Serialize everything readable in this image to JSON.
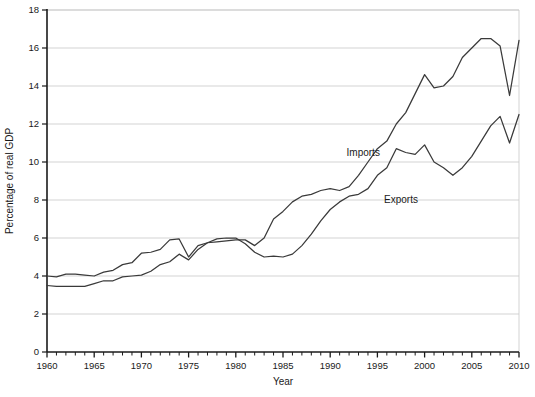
{
  "chart_data": {
    "type": "line",
    "title": "",
    "xlabel": "Year",
    "ylabel": "Percentage of real GDP",
    "xlim": [
      1960,
      2010
    ],
    "ylim": [
      0,
      18
    ],
    "grid": true,
    "grid_axis": "y",
    "legend": "inline-labels",
    "xticks": [
      1960,
      1965,
      1970,
      1975,
      1980,
      1985,
      1990,
      1995,
      2000,
      2005,
      2010
    ],
    "xticklabels": [
      "1960",
      "1965",
      "1970",
      "1975",
      "1980",
      "1985",
      "1990",
      "1995",
      "2000",
      "2005",
      "2010"
    ],
    "xminor_tick_interval": 1,
    "yticks": [
      0,
      2,
      4,
      6,
      8,
      10,
      12,
      14,
      16,
      18
    ],
    "yticklabels": [
      "0",
      "2",
      "4",
      "6",
      "8",
      "10",
      "12",
      "14",
      "16",
      "18"
    ],
    "x": [
      1960,
      1961,
      1962,
      1963,
      1964,
      1965,
      1966,
      1967,
      1968,
      1969,
      1970,
      1971,
      1972,
      1973,
      1974,
      1975,
      1976,
      1977,
      1978,
      1979,
      1980,
      1981,
      1982,
      1983,
      1984,
      1985,
      1986,
      1987,
      1988,
      1989,
      1990,
      1991,
      1992,
      1993,
      1994,
      1995,
      1996,
      1997,
      1998,
      1999,
      2000,
      2001,
      2002,
      2003,
      2004,
      2005,
      2006,
      2007,
      2008,
      2009,
      2010
    ],
    "series": [
      {
        "name": "Imports",
        "label": "Imports",
        "color": "#3a3a3a",
        "values": [
          3.5,
          3.45,
          3.45,
          3.45,
          3.45,
          3.6,
          3.75,
          3.75,
          3.95,
          4.0,
          4.05,
          4.25,
          4.6,
          4.75,
          5.15,
          4.85,
          5.4,
          5.75,
          5.8,
          5.85,
          5.9,
          5.9,
          5.6,
          6.0,
          7.0,
          7.4,
          7.9,
          8.2,
          8.3,
          8.5,
          8.6,
          8.5,
          8.7,
          9.3,
          10.0,
          10.7,
          11.1,
          12.0,
          12.6,
          13.6,
          14.6,
          13.9,
          14.0,
          14.5,
          15.5,
          16.0,
          16.5,
          16.5,
          16.1,
          13.5,
          16.4
        ]
      },
      {
        "name": "Exports",
        "label": "Exports",
        "color": "#3a3a3a",
        "values": [
          4.0,
          3.95,
          4.1,
          4.1,
          4.05,
          4.0,
          4.2,
          4.3,
          4.6,
          4.7,
          5.2,
          5.25,
          5.4,
          5.9,
          5.95,
          5.0,
          5.6,
          5.75,
          5.95,
          6.0,
          6.0,
          5.7,
          5.25,
          5.0,
          5.05,
          5.0,
          5.15,
          5.6,
          6.2,
          6.9,
          7.5,
          7.9,
          8.2,
          8.3,
          8.6,
          9.3,
          9.7,
          10.7,
          10.5,
          10.4,
          10.9,
          10.0,
          9.7,
          9.3,
          9.7,
          10.3,
          11.1,
          11.9,
          12.4,
          11.0,
          12.5
        ]
      }
    ],
    "annotations": [
      {
        "name": "imports-label",
        "text": "Imports",
        "x": 1993.5,
        "y": 10.3
      },
      {
        "name": "exports-label",
        "text": "Exports",
        "x": 1997.5,
        "y": 7.85
      }
    ]
  }
}
